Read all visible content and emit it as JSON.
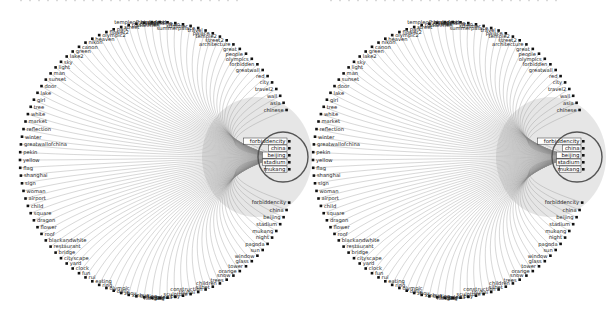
{
  "figure": {
    "type": "radial-bundled-graph",
    "panels": [
      {
        "id": "left",
        "center": [
          158,
          160
        ],
        "radius": 138,
        "highlight_ring": {
          "cx": 283,
          "cy": 157,
          "r": 25
        },
        "highlighted_labels": [
          "forbiddencity",
          "china",
          "beijing",
          "stadium",
          "mukang"
        ]
      },
      {
        "id": "right",
        "center": [
          451,
          160
        ],
        "radius": 138,
        "highlight_ring": {
          "cx": 577,
          "cy": 157,
          "r": 25
        },
        "highlighted_labels": [
          "forbiddencity",
          "china",
          "beijing",
          "stadium",
          "mukang"
        ]
      }
    ],
    "labels": [
      "forbiddencity",
      "china",
      "beijing",
      "stadium",
      "mukang",
      "night",
      "pagoda",
      "sun",
      "window",
      "glass",
      "tower",
      "orange",
      "snow",
      "trees",
      "children",
      "silbet",
      "construction",
      "touhai",
      "sculpture",
      "boy",
      "panda",
      "kong",
      "hong",
      "lisa",
      "temple",
      "station",
      "xinhua",
      "zhou",
      "daily",
      "olympic",
      "ring",
      "eating",
      "rui",
      "fun",
      "clock",
      "yard",
      "cityscape",
      "bridge",
      "restaurant",
      "blackandwhite",
      "roof",
      "flower",
      "dragon",
      "square",
      "child",
      "airport",
      "woman",
      "sign",
      "shanghai",
      "flag",
      "yellow",
      "pekin",
      "greatwallofchina",
      "winter",
      "reflection",
      "market",
      "white",
      "tree",
      "girl",
      "lake",
      "door",
      "sunset",
      "man",
      "light",
      "sky",
      "lake2",
      "green",
      "canon",
      "nikon",
      "heaven",
      "olympic2",
      "flower2",
      "park",
      "street",
      "tiananmen",
      "portrait",
      "tea",
      "food",
      "templeofheaven",
      "birdsnest",
      "building",
      "mao",
      "summer",
      "summerpalace",
      "travel",
      "palace",
      "temple2",
      "street2",
      "architecture",
      "great",
      "people",
      "olympics",
      "forbidden",
      "greatwall",
      "red",
      "city",
      "travel2",
      "wall",
      "asia",
      "chinese"
    ],
    "caption_fragments_top": [
      "(clipped caption text above figure, not legible)"
    ]
  }
}
